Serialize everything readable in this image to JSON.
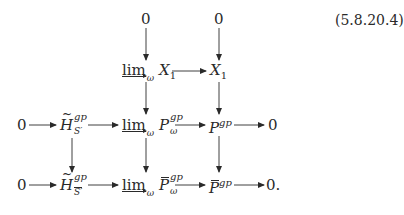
{
  "equation_number": "(5.8.20.4)",
  "diagram": {
    "type": "commutative-diagram",
    "rows": [
      {
        "row": 0,
        "nodes": [
          "0",
          "0"
        ]
      },
      {
        "row": 1,
        "nodes": [
          "lim→_ω X_1",
          "X_1"
        ]
      },
      {
        "row": 2,
        "nodes": [
          "0",
          "H̃^{gp}_{S'}",
          "lim→_ω P^{gp}_ω",
          "P^{gp}",
          "0"
        ]
      },
      {
        "row": 3,
        "nodes": [
          "0",
          "H̃^{gp}_{S̄'}",
          "lim→_ω P̄^{gp}_ω",
          "P̄^{gp}",
          "0."
        ]
      }
    ],
    "labels": {
      "zero": "0",
      "zero_period": "0.",
      "lim": "lim",
      "omega": "ω",
      "X": "X",
      "one": "1",
      "H": "H",
      "P": "P",
      "gp": "gp",
      "S_prime": "S′"
    }
  }
}
